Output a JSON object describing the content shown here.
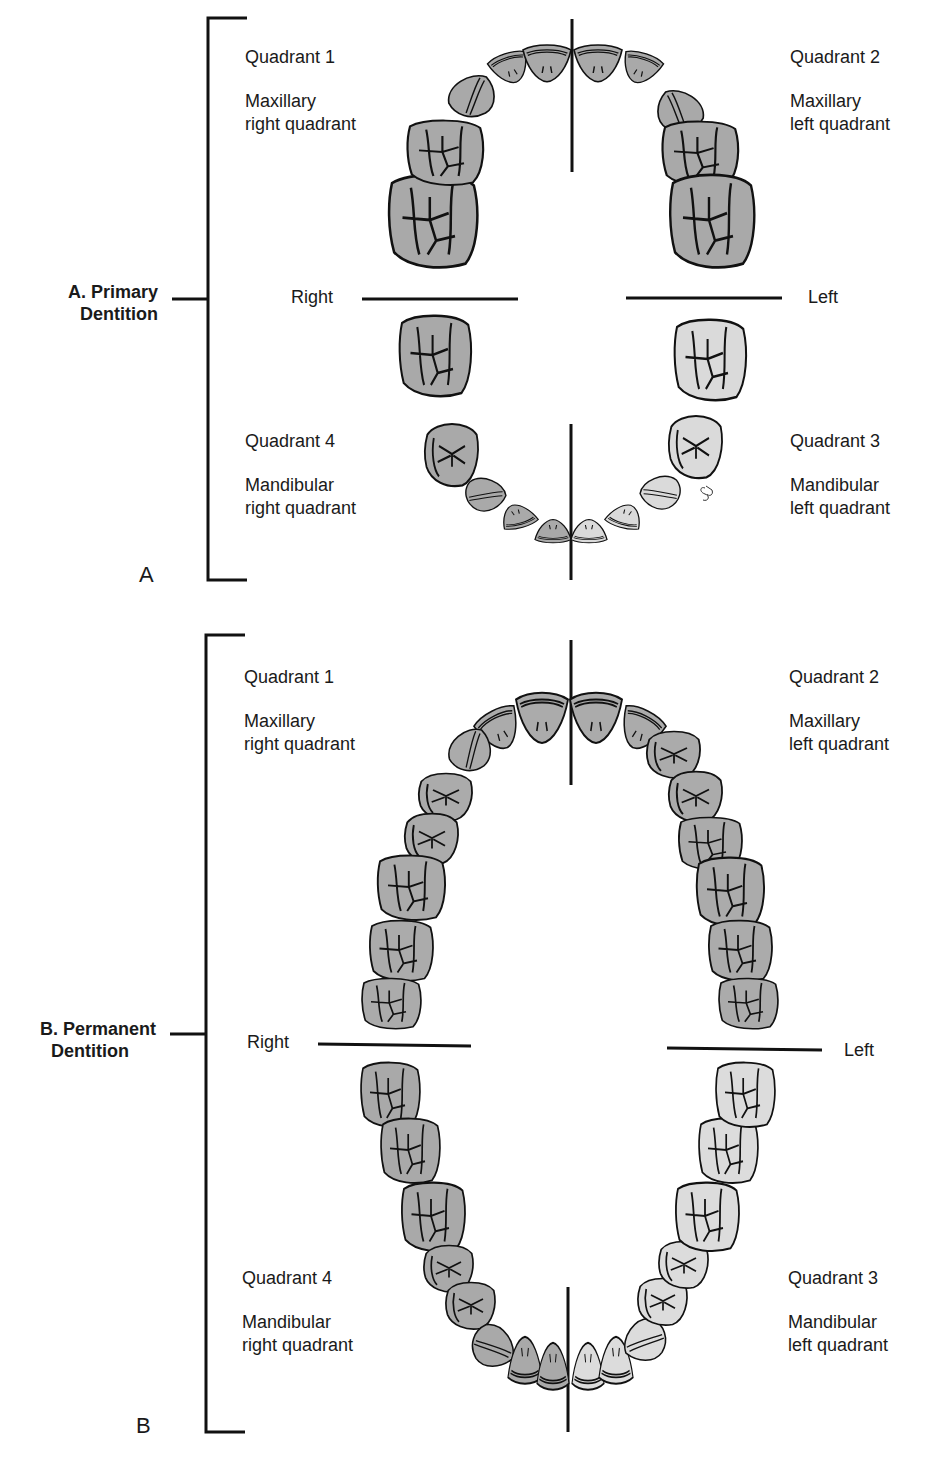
{
  "colors": {
    "line": "#111111",
    "tooth_dark": "#a8a8a8",
    "tooth_mid": "#b9b9b9",
    "tooth_light": "#dedede",
    "text": "#1a1a1a"
  },
  "panel_a": {
    "letter": "A",
    "section_title_line1": "A. Primary",
    "section_title_line2": "Dentition",
    "side_right": "Right",
    "side_left": "Left",
    "quadrants": [
      {
        "name": "Quadrant 1",
        "desc_line1": "Maxillary",
        "desc_line2": "right quadrant"
      },
      {
        "name": "Quadrant 2",
        "desc_line1": "Maxillary",
        "desc_line2": "left quadrant"
      },
      {
        "name": "Quadrant 3",
        "desc_line1": "Mandibular",
        "desc_line2": "left quadrant"
      },
      {
        "name": "Quadrant 4",
        "desc_line1": "Mandibular",
        "desc_line2": "right quadrant"
      }
    ],
    "teeth_per_quadrant": 5
  },
  "panel_b": {
    "letter": "B",
    "section_title_line1": "B. Permanent",
    "section_title_line2": "Dentition",
    "side_right": "Right",
    "side_left": "Left",
    "quadrants": [
      {
        "name": "Quadrant 1",
        "desc_line1": "Maxillary",
        "desc_line2": "right quadrant"
      },
      {
        "name": "Quadrant 2",
        "desc_line1": "Maxillary",
        "desc_line2": "left quadrant"
      },
      {
        "name": "Quadrant 3",
        "desc_line1": "Mandibular",
        "desc_line2": "left quadrant"
      },
      {
        "name": "Quadrant 4",
        "desc_line1": "Mandibular",
        "desc_line2": "right quadrant"
      }
    ],
    "teeth_per_quadrant": 8
  }
}
